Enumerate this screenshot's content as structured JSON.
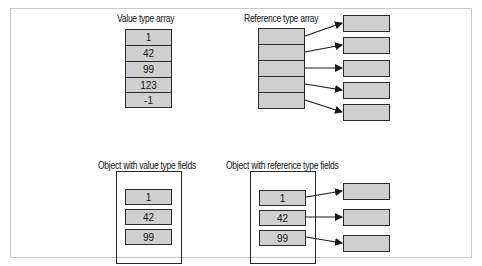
{
  "diagram": {
    "value_array": {
      "title": "Value type array",
      "values": [
        "1",
        "42",
        "99",
        "123",
        "-1"
      ]
    },
    "reference_array": {
      "title": "Reference type array",
      "slots": 5
    },
    "object_value_fields": {
      "title": "Object with value type fields",
      "values": [
        "1",
        "42",
        "99"
      ]
    },
    "object_reference_fields": {
      "title": "Object with reference type fields",
      "values": [
        "1",
        "42",
        "99"
      ]
    },
    "colors": {
      "cell_fill": "#cfcfcf",
      "stroke": "#2a2a2a",
      "frame": "#c8c8c8"
    }
  }
}
